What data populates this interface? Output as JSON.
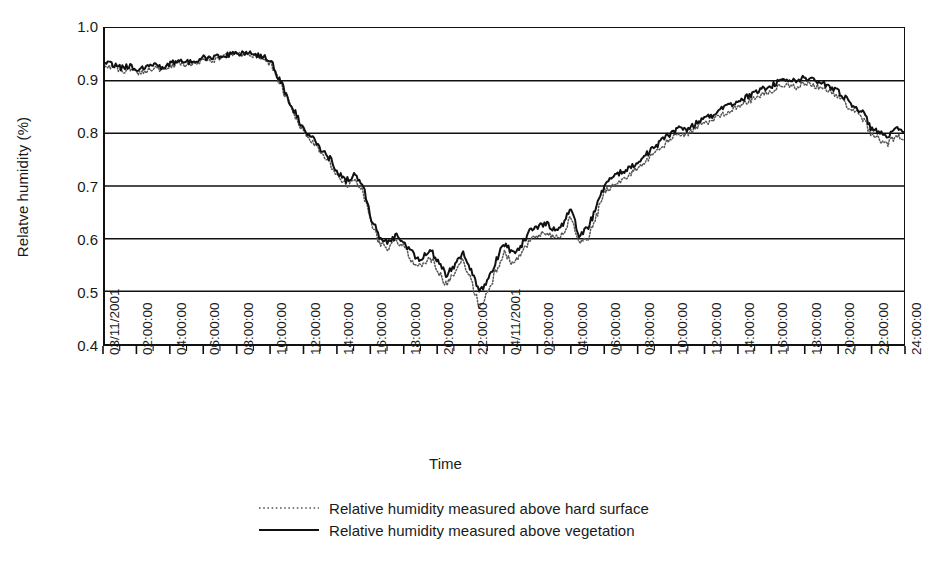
{
  "chart_data": {
    "type": "line",
    "title": "",
    "xlabel": "Time",
    "ylabel": "Relatve humidity (%)",
    "ylim": [
      0.4,
      1.0
    ],
    "ytick_values": [
      1.0,
      0.9,
      0.8,
      0.7,
      0.6,
      0.5,
      0.4
    ],
    "ytick_labels": [
      "1.0",
      "0.9",
      "0.8",
      "0.7",
      "0.6",
      "0.5",
      "0.4"
    ],
    "grid": "horizontal",
    "legend_position": "bottom-center",
    "xlim_hours": [
      0,
      48
    ],
    "xtick_labels": [
      "03/11/2001",
      "02:00:00",
      "04:00:00",
      "06:00:00",
      "08:00:00",
      "10:00:00",
      "12:00:00",
      "14:00:00",
      "16:00:00",
      "18:00:00",
      "20:00:00",
      "22:00:00",
      "04/11/2001",
      "02:00:00",
      "04:00:00",
      "06:00:00",
      "08:00:00",
      "10:00:00",
      "12:00:00",
      "14:00:00",
      "16:00:00",
      "18:00:00",
      "20:00:00",
      "22:00:00",
      "24:00:00"
    ],
    "xtick_hours": [
      0,
      2,
      4,
      6,
      8,
      10,
      12,
      14,
      16,
      18,
      20,
      22,
      24,
      26,
      28,
      30,
      32,
      34,
      36,
      38,
      40,
      42,
      44,
      46,
      48
    ],
    "minor_tick_interval_hours": 1,
    "series": [
      {
        "name": "Relative humidity measured above hard surface",
        "style": "dotted",
        "color": "#555555",
        "x_hours": [
          0,
          0.5,
          1,
          1.5,
          2,
          2.5,
          3,
          3.5,
          4,
          4.5,
          5,
          5.5,
          6,
          6.5,
          7,
          7.5,
          8,
          8.5,
          9,
          9.5,
          10,
          10.5,
          11,
          11.5,
          12,
          12.5,
          13,
          13.5,
          14,
          14.5,
          15,
          15.5,
          16,
          16.5,
          17,
          17.5,
          18,
          18.5,
          19,
          19.5,
          20,
          20.5,
          21,
          21.5,
          22,
          22.5,
          23,
          23.5,
          24,
          24.5,
          25,
          25.5,
          26,
          26.5,
          27,
          27.5,
          28,
          28.5,
          29,
          29.5,
          30,
          30.5,
          31,
          31.5,
          32,
          32.5,
          33,
          33.5,
          34,
          34.5,
          35,
          35.5,
          36,
          36.5,
          37,
          37.5,
          38,
          38.5,
          39,
          39.5,
          40,
          40.5,
          41,
          41.5,
          42,
          42.5,
          43,
          43.5,
          44,
          44.5,
          45,
          45.5,
          46,
          46.5,
          47,
          47.5,
          48
        ],
        "values": [
          0.93,
          0.925,
          0.918,
          0.922,
          0.915,
          0.92,
          0.925,
          0.918,
          0.928,
          0.933,
          0.93,
          0.936,
          0.94,
          0.938,
          0.944,
          0.948,
          0.95,
          0.95,
          0.948,
          0.944,
          0.93,
          0.895,
          0.86,
          0.826,
          0.8,
          0.782,
          0.76,
          0.742,
          0.718,
          0.7,
          0.712,
          0.69,
          0.63,
          0.592,
          0.582,
          0.596,
          0.582,
          0.556,
          0.546,
          0.566,
          0.54,
          0.512,
          0.534,
          0.56,
          0.52,
          0.47,
          0.498,
          0.54,
          0.572,
          0.552,
          0.568,
          0.596,
          0.605,
          0.612,
          0.6,
          0.608,
          0.642,
          0.59,
          0.6,
          0.64,
          0.69,
          0.7,
          0.712,
          0.72,
          0.735,
          0.748,
          0.76,
          0.775,
          0.79,
          0.8,
          0.796,
          0.81,
          0.82,
          0.824,
          0.836,
          0.842,
          0.852,
          0.858,
          0.866,
          0.874,
          0.88,
          0.888,
          0.892,
          0.888,
          0.896,
          0.892,
          0.886,
          0.88,
          0.872,
          0.856,
          0.842,
          0.83,
          0.8,
          0.79,
          0.778,
          0.796,
          0.79
        ]
      },
      {
        "name": "Relative humidity measured above vegetation",
        "style": "solid",
        "color": "#111111",
        "x_hours": [
          0,
          0.5,
          1,
          1.5,
          2,
          2.5,
          3,
          3.5,
          4,
          4.5,
          5,
          5.5,
          6,
          6.5,
          7,
          7.5,
          8,
          8.5,
          9,
          9.5,
          10,
          10.5,
          11,
          11.5,
          12,
          12.5,
          13,
          13.5,
          14,
          14.5,
          15,
          15.5,
          16,
          16.5,
          17,
          17.5,
          18,
          18.5,
          19,
          19.5,
          20,
          20.5,
          21,
          21.5,
          22,
          22.5,
          23,
          23.5,
          24,
          24.5,
          25,
          25.5,
          26,
          26.5,
          27,
          27.5,
          28,
          28.5,
          29,
          29.5,
          30,
          30.5,
          31,
          31.5,
          32,
          32.5,
          33,
          33.5,
          34,
          34.5,
          35,
          35.5,
          36,
          36.5,
          37,
          37.5,
          38,
          38.5,
          39,
          39.5,
          40,
          40.5,
          41,
          41.5,
          42,
          42.5,
          43,
          43.5,
          44,
          44.5,
          45,
          45.5,
          46,
          46.5,
          47,
          47.5,
          48
        ],
        "values": [
          0.936,
          0.93,
          0.924,
          0.928,
          0.922,
          0.926,
          0.93,
          0.924,
          0.934,
          0.938,
          0.936,
          0.94,
          0.944,
          0.942,
          0.948,
          0.95,
          0.952,
          0.952,
          0.95,
          0.946,
          0.934,
          0.9,
          0.868,
          0.834,
          0.808,
          0.79,
          0.77,
          0.752,
          0.726,
          0.71,
          0.722,
          0.7,
          0.64,
          0.6,
          0.592,
          0.606,
          0.594,
          0.57,
          0.56,
          0.58,
          0.556,
          0.53,
          0.55,
          0.576,
          0.54,
          0.496,
          0.52,
          0.56,
          0.59,
          0.572,
          0.588,
          0.614,
          0.622,
          0.63,
          0.618,
          0.626,
          0.656,
          0.608,
          0.62,
          0.658,
          0.704,
          0.714,
          0.726,
          0.734,
          0.748,
          0.76,
          0.772,
          0.788,
          0.8,
          0.812,
          0.806,
          0.82,
          0.83,
          0.834,
          0.846,
          0.852,
          0.862,
          0.868,
          0.876,
          0.884,
          0.89,
          0.898,
          0.902,
          0.898,
          0.906,
          0.902,
          0.896,
          0.89,
          0.882,
          0.866,
          0.852,
          0.84,
          0.812,
          0.802,
          0.79,
          0.808,
          0.802
        ]
      }
    ],
    "annotations": []
  },
  "legend": {
    "items": [
      {
        "label": "Relative humidity measured above hard surface",
        "style": "dotted"
      },
      {
        "label": "Relative humidity measured above vegetation",
        "style": "solid"
      }
    ]
  },
  "axes": {
    "x_title": "Time",
    "y_title": "Relatve humidity (%)"
  }
}
